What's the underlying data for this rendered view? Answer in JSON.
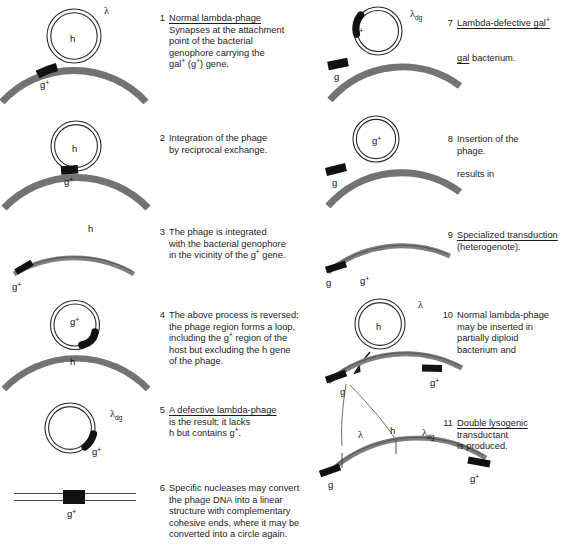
{
  "figure": {
    "background": "#ffffff",
    "colors": {
      "genophore_gray": "#8c8c8c",
      "genophore_outline": "#3a3a3a",
      "marker_black": "#111111",
      "text": "#1d1d1d",
      "thin_line": "#555555"
    }
  },
  "steps": [
    {
      "number": "1",
      "lines": [
        {
          "text": "Normal lambda-phage",
          "underline": true
        },
        {
          "text": "Synapses at the attachment",
          "underline": false
        },
        {
          "text": "point of the bacterial",
          "underline": false
        },
        {
          "text": "genophore carrying the",
          "underline": false
        },
        {
          "text": "gal+ (g+) gene.",
          "underline": false
        }
      ]
    },
    {
      "number": "2",
      "lines": [
        {
          "text": "Integration of the phage",
          "underline": false
        },
        {
          "text": "by reciprocal exchange.",
          "underline": false
        }
      ]
    },
    {
      "number": "3",
      "lines": [
        {
          "text": "The phage is integrated",
          "underline": false
        },
        {
          "text": "with the bacterial genophore",
          "underline": false
        },
        {
          "text": "in the vicinity of the g+ gene.",
          "underline": false
        }
      ]
    },
    {
      "number": "4",
      "lines": [
        {
          "text": "The above process is reversed;",
          "underline": false
        },
        {
          "text": "the phage region forms a loop,",
          "underline": false
        },
        {
          "text": "including the g+ region of the",
          "underline": false
        },
        {
          "text": "host but excluding the h gene",
          "underline": false
        },
        {
          "text": "of the phage.",
          "underline": false
        }
      ]
    },
    {
      "number": "5",
      "lines": [
        {
          "text": "A defective lambda-phage",
          "underline": true
        },
        {
          "text": "is the result; it lacks",
          "underline": false
        },
        {
          "text": "h but contains g+.",
          "underline": false
        }
      ]
    },
    {
      "number": "6",
      "lines": [
        {
          "text": "Specific nucleases may convert",
          "underline": false
        },
        {
          "text": "the phage DNA into a linear",
          "underline": false
        },
        {
          "text": "structure with complementary",
          "underline": false
        },
        {
          "text": "cohesive ends, where it may be",
          "underline": false
        },
        {
          "text": "converted into a circle again.",
          "underline": false
        }
      ]
    },
    {
      "number": "7",
      "lines": [
        {
          "text": "Lambda-defective gal+",
          "underline": true
        },
        {
          "text": "",
          "underline": false
        },
        {
          "text": "gal bacterium.",
          "underline": false,
          "underline_first_word": true
        }
      ]
    },
    {
      "number": "8",
      "lines": [
        {
          "text": "Insertion of the",
          "underline": false
        },
        {
          "text": "phage.",
          "underline": false
        },
        {
          "text": "",
          "underline": false
        },
        {
          "text": "results in",
          "underline": false
        }
      ]
    },
    {
      "number": "9",
      "lines": [
        {
          "text": "Specialized transduction",
          "underline": true
        },
        {
          "text": "(heterogenote).",
          "underline": false
        }
      ]
    },
    {
      "number": "10",
      "lines": [
        {
          "text": "Normal lambda-phage",
          "underline": false
        },
        {
          "text": "may be inserted in",
          "underline": false
        },
        {
          "text": "partially diploid",
          "underline": false
        },
        {
          "text": "bacterium and",
          "underline": false
        }
      ]
    },
    {
      "number": "11",
      "lines": [
        {
          "text": "Double lysogenic",
          "underline": true
        },
        {
          "text": "transductant",
          "underline": false
        },
        {
          "text": "is produced.",
          "underline": false
        }
      ]
    }
  ],
  "diagram_labels": {
    "lambda": "λ",
    "lambda_dg_base": "λ",
    "lambda_dg_sub": "dg",
    "h": "h",
    "g_plus": "g",
    "g_plus_sup": "+",
    "g": "g"
  },
  "panel_labels": {
    "p1": {
      "lambda": "λ",
      "circle": "h",
      "arc": "g+"
    },
    "p2": {
      "circle": "h",
      "arc": "g+"
    },
    "p3": {
      "top": "h",
      "left": "g+"
    },
    "p4": {
      "circle": "g+",
      "arc": "h"
    },
    "p5": {
      "lambda_dg": "λdg",
      "marker": "g+"
    },
    "p6": {
      "marker": "g+"
    },
    "p7": {
      "lambda_dg": "λdg",
      "circle": "g+",
      "arc": "g"
    },
    "p8": {
      "circle": "g+",
      "arc": "g"
    },
    "p9": {
      "left": "g",
      "right": "g+"
    },
    "p10": {
      "lambda": "λ",
      "circle": "h",
      "left": "g",
      "right": "g+"
    },
    "p11": {
      "lambda": "λ",
      "h": "h",
      "lambda_dg": "λdg",
      "left": "g",
      "right": "g+"
    }
  }
}
